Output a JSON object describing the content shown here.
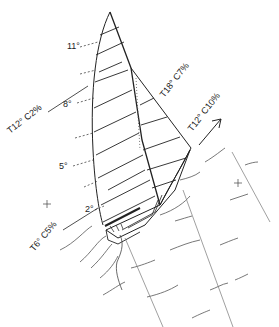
{
  "diagram": {
    "sail_sections": {
      "mainsail_twist_angles": [
        {
          "label": "11°",
          "x": 67,
          "y": 49
        },
        {
          "label": "8°",
          "x": 63,
          "y": 107
        },
        {
          "label": "5°",
          "x": 59,
          "y": 169
        },
        {
          "label": "2°",
          "x": 85,
          "y": 212
        }
      ]
    },
    "annotations": [
      {
        "id": "main-top",
        "label": "T12°  C2%",
        "x": 10,
        "y": 130,
        "rotate": -38
      },
      {
        "id": "jib-top",
        "label": "T18°  C7%",
        "x": 170,
        "y": 99,
        "rotate": -52
      },
      {
        "id": "jib-low",
        "label": "T12°  C10%",
        "x": 196,
        "y": 128,
        "rotate": -52
      },
      {
        "id": "main-foot",
        "label": "T6°  C5%",
        "x": 33,
        "y": 250,
        "rotate": -50
      }
    ],
    "wind_arrow": {
      "direction": "up-right"
    },
    "marks": [
      {
        "symbol": "+",
        "x": 47,
        "y": 204
      },
      {
        "symbol": "+",
        "x": 238,
        "y": 183
      }
    ],
    "colors": {
      "ink": "#222222",
      "light_ink": "#777777",
      "background": "#ffffff"
    }
  }
}
